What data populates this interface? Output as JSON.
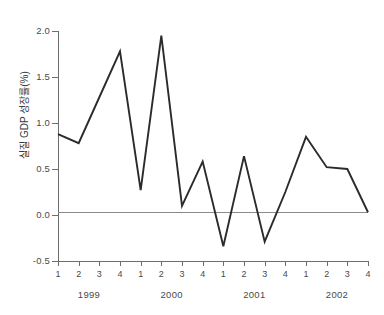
{
  "chart_data": {
    "type": "line",
    "title": "",
    "xlabel": "",
    "ylabel": "실질 GDP 성장률(%)",
    "ylim": [
      -0.5,
      2.0
    ],
    "ytick_labels": [
      "2.0",
      "1.5",
      "1.0",
      "0.5",
      "0.0",
      "-0.5"
    ],
    "ytick_values": [
      2.0,
      1.5,
      1.0,
      0.5,
      0.0,
      -0.5
    ],
    "grid": false,
    "legend": null,
    "zero_line": true,
    "line_color": "#2b2b2b",
    "axis_color": "#6e6e6e",
    "background_color": "#ffffff",
    "x": [
      "1",
      "2",
      "3",
      "4",
      "1",
      "2",
      "3",
      "4",
      "1",
      "2",
      "3",
      "4",
      "1",
      "2",
      "3",
      "4"
    ],
    "categories": [
      "1999 Q1",
      "1999 Q2",
      "1999 Q3",
      "1999 Q4",
      "2000 Q1",
      "2000 Q2",
      "2000 Q3",
      "2000 Q4",
      "2001 Q1",
      "2001 Q2",
      "2001 Q3",
      "2001 Q4",
      "2002 Q1",
      "2002 Q2",
      "2002 Q3",
      "2002 Q4"
    ],
    "values": [
      0.88,
      0.78,
      1.28,
      1.78,
      0.27,
      1.95,
      0.1,
      0.58,
      -0.34,
      0.64,
      -0.29,
      0.25,
      0.85,
      0.52,
      0.5,
      0.03
    ],
    "groups": [
      {
        "label": "1999",
        "quarters": [
          "1",
          "2",
          "3",
          "4"
        ]
      },
      {
        "label": "2000",
        "quarters": [
          "1",
          "2",
          "3",
          "4"
        ]
      },
      {
        "label": "2001",
        "quarters": [
          "1",
          "2",
          "3",
          "4"
        ]
      },
      {
        "label": "2002",
        "quarters": [
          "1",
          "2",
          "3",
          "4"
        ]
      }
    ]
  }
}
